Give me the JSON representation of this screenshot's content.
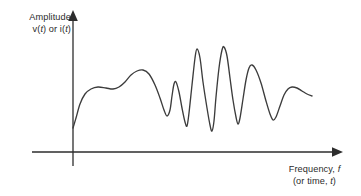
{
  "figure": {
    "background_color": "#ffffff",
    "curve_color": "#3c3c3c",
    "axis_color": "#2d2d2d",
    "text_color": "#2b2b2b"
  },
  "y_axis": {
    "label_line1": "Amplitude",
    "label_line2_prefix": "v(",
    "label_line2_var1": "t",
    "label_line2_middle": ") or i(",
    "label_line2_var2": "t",
    "label_line2_suffix": ")",
    "arrow": "arrow-up"
  },
  "x_axis": {
    "label_line1_text": "Frequency, ",
    "label_line1_var": "f",
    "label_line2_prefix": "(or time, ",
    "label_line2_var": "t",
    "label_line2_suffix": ")",
    "arrow": "arrow-right"
  },
  "chart_data": {
    "type": "line",
    "title": "",
    "xlabel": "Frequency, f (or time, t)",
    "ylabel": "Amplitude v(t) or i(t)",
    "grid": false,
    "legend": null,
    "axis_origin_px": {
      "x": 73,
      "y": 152
    },
    "xlim_px": [
      73,
      290
    ],
    "ylim_px": [
      152,
      20
    ],
    "series": [
      {
        "name": "signal",
        "color": "#3c3c3c",
        "points_px": [
          [
            73,
            128
          ],
          [
            76,
            118
          ],
          [
            80,
            104
          ],
          [
            85,
            94
          ],
          [
            91,
            89
          ],
          [
            98,
            87
          ],
          [
            106,
            88
          ],
          [
            113,
            89
          ],
          [
            119,
            87
          ],
          [
            125,
            82
          ],
          [
            131,
            75
          ],
          [
            137,
            71
          ],
          [
            143,
            70
          ],
          [
            149,
            74
          ],
          [
            155,
            85
          ],
          [
            160,
            98
          ],
          [
            164,
            110
          ],
          [
            167,
            116
          ],
          [
            170,
            110
          ],
          [
            172,
            96
          ],
          [
            174,
            84
          ],
          [
            176,
            82
          ],
          [
            179,
            92
          ],
          [
            182,
            108
          ],
          [
            185,
            122
          ],
          [
            187,
            126
          ],
          [
            189,
            113
          ],
          [
            192,
            85
          ],
          [
            195,
            58
          ],
          [
            197,
            49
          ],
          [
            200,
            58
          ],
          [
            203,
            82
          ],
          [
            207,
            108
          ],
          [
            210,
            125
          ],
          [
            212,
            131
          ],
          [
            214,
            121
          ],
          [
            216,
            97
          ],
          [
            219,
            68
          ],
          [
            222,
            50
          ],
          [
            224,
            47
          ],
          [
            227,
            56
          ],
          [
            230,
            78
          ],
          [
            233,
            100
          ],
          [
            236,
            117
          ],
          [
            238,
            124
          ],
          [
            240,
            118
          ],
          [
            243,
            99
          ],
          [
            246,
            80
          ],
          [
            249,
            68
          ],
          [
            252,
            65
          ],
          [
            256,
            70
          ],
          [
            261,
            83
          ],
          [
            266,
            101
          ],
          [
            270,
            114
          ],
          [
            273,
            120
          ],
          [
            276,
            117
          ],
          [
            280,
            106
          ],
          [
            284,
            95
          ],
          [
            288,
            89
          ],
          [
            292,
            87
          ],
          [
            297,
            88
          ],
          [
            302,
            91
          ],
          [
            307,
            94
          ],
          [
            312,
            96
          ]
        ]
      }
    ]
  }
}
